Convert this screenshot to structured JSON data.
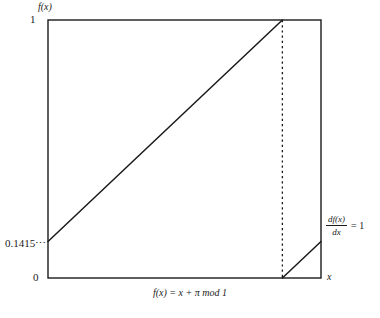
{
  "figure": {
    "caption": "f(x) = x + π mod 1",
    "y_axis_label": "f(x)",
    "x_axis_label": "x",
    "y_ticks": {
      "top": "1",
      "bottom": "0",
      "value": "0.1415⋯"
    },
    "derivative_annotation": {
      "numerator": "df(x)",
      "denominator": "dx",
      "equals": "= 1"
    },
    "colors": {
      "line": "#1a1a1a",
      "frame": "#1a1a1a",
      "background": "#ffffff"
    }
  },
  "chart_data": {
    "type": "line",
    "title": "f(x) = x + π mod 1",
    "xlabel": "x",
    "ylabel": "f(x)",
    "xlim": [
      0,
      1
    ],
    "ylim": [
      0,
      1
    ],
    "grid": false,
    "legend": "none",
    "y_tick_values": [
      0,
      0.1415,
      1
    ],
    "y_tick_labels": [
      "0",
      "0.1415⋯",
      "1"
    ],
    "x_tick_values": [],
    "x_tick_labels": [],
    "discontinuity_x": 0.8585,
    "series": [
      {
        "name": "branch-1",
        "x": [
          0,
          0.8585
        ],
        "values": [
          0.1415,
          1
        ]
      },
      {
        "name": "branch-2",
        "x": [
          0.8585,
          1
        ],
        "values": [
          0,
          0.1415
        ]
      }
    ],
    "annotations": [
      {
        "name": "discontinuity-guide",
        "type": "vline",
        "x": 0.8585,
        "style": "dotted"
      },
      {
        "name": "slope-label",
        "text": "df(x)/dx = 1",
        "x": 1.0,
        "y": 0.25
      }
    ]
  }
}
